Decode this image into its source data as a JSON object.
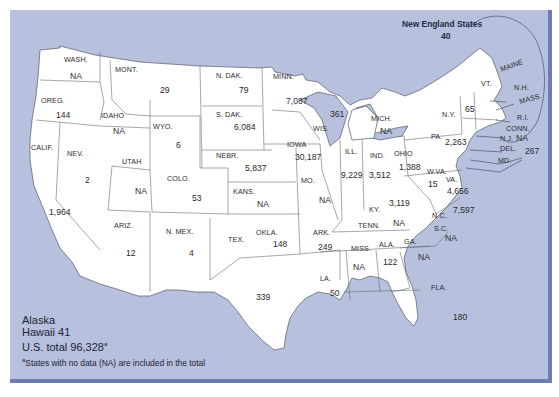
{
  "map": {
    "title_region": "New England States",
    "new_england_value": "40",
    "water_color": "#b7c0dc",
    "land_color": "#ffffff",
    "border_color": "#6b7db3",
    "states": [
      {
        "abbr": "WASH.",
        "value": "NA"
      },
      {
        "abbr": "OREG.",
        "value": "144"
      },
      {
        "abbr": "CALIF.",
        "value": "1,964"
      },
      {
        "abbr": "IDAHO",
        "value": "NA"
      },
      {
        "abbr": "NEV.",
        "value": "2"
      },
      {
        "abbr": "MONT.",
        "value": "29"
      },
      {
        "abbr": "WYO.",
        "value": "6"
      },
      {
        "abbr": "UTAH",
        "value": "NA"
      },
      {
        "abbr": "ARIZ.",
        "value": "12"
      },
      {
        "abbr": "COLO.",
        "value": "53"
      },
      {
        "abbr": "N. MEX.",
        "value": "4"
      },
      {
        "abbr": "N. DAK.",
        "value": "79"
      },
      {
        "abbr": "S. DAK.",
        "value": "6,084"
      },
      {
        "abbr": "NEBR.",
        "value": "5,837"
      },
      {
        "abbr": "KANS.",
        "value": "NA"
      },
      {
        "abbr": "OKLA.",
        "value": "148"
      },
      {
        "abbr": "TEX.",
        "value": "339"
      },
      {
        "abbr": "MINN.",
        "value": "7,087"
      },
      {
        "abbr": "IOWA",
        "value": "30,187"
      },
      {
        "abbr": "MO.",
        "value": "NA"
      },
      {
        "abbr": "ARK.",
        "value": "249"
      },
      {
        "abbr": "LA.",
        "value": "50"
      },
      {
        "abbr": "WIS.",
        "value": "361"
      },
      {
        "abbr": "ILL.",
        "value": "9,229"
      },
      {
        "abbr": "MICH.",
        "value": "NA"
      },
      {
        "abbr": "IND.",
        "value": "3,512"
      },
      {
        "abbr": "OHIO",
        "value": "1,388"
      },
      {
        "abbr": "KY.",
        "value": "3,119"
      },
      {
        "abbr": "TENN.",
        "value": "NA"
      },
      {
        "abbr": "MISS.",
        "value": "NA"
      },
      {
        "abbr": "ALA.",
        "value": "122"
      },
      {
        "abbr": "GA.",
        "value": "NA"
      },
      {
        "abbr": "FLA.",
        "value": "180"
      },
      {
        "abbr": "S.C.",
        "value": "NA"
      },
      {
        "abbr": "N.C.",
        "value": "7,597"
      },
      {
        "abbr": "VA.",
        "value": "4,656"
      },
      {
        "abbr": "W.VA.",
        "value": "15"
      },
      {
        "abbr": "PA.",
        "value": "2,263"
      },
      {
        "abbr": "N.Y.",
        "value": "65"
      },
      {
        "abbr": "N.J.",
        "value": "NA"
      },
      {
        "abbr": "DEL.",
        "value": "267"
      },
      {
        "abbr": "MD.",
        "value": ""
      },
      {
        "abbr": "VT.",
        "value": ""
      },
      {
        "abbr": "MAINE",
        "value": ""
      },
      {
        "abbr": "N.H.",
        "value": ""
      },
      {
        "abbr": "MASS.",
        "value": ""
      },
      {
        "abbr": "R.I.",
        "value": ""
      },
      {
        "abbr": "CONN.",
        "value": ""
      }
    ]
  },
  "legend": {
    "alaska": "Alaska",
    "hawaii": "Hawaii 41",
    "total_label": "U.S. total 96,328",
    "total_marker": "a",
    "footnote_marker": "a",
    "footnote": "States with no data (NA) are included in the total"
  }
}
